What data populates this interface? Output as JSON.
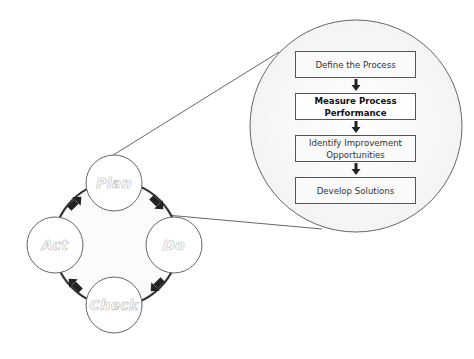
{
  "diagram": {
    "cycle": {
      "nodes": [
        {
          "id": "plan",
          "label": "Plan"
        },
        {
          "id": "do",
          "label": "Do"
        },
        {
          "id": "check",
          "label": "Check"
        },
        {
          "id": "act",
          "label": "Act"
        }
      ],
      "direction": "clockwise",
      "arrows": [
        "plan->do",
        "do->check",
        "check->act",
        "act->plan"
      ]
    },
    "zoom_detail": {
      "expands": "Plan",
      "steps": [
        {
          "label": "Define the Process",
          "emphasized": false
        },
        {
          "label": "Measure Process Performance",
          "emphasized": true
        },
        {
          "label": "Identify Improvement Opportunities",
          "emphasized": false
        },
        {
          "label": "Develop Solutions",
          "emphasized": false
        }
      ]
    },
    "colors": {
      "line": "#555555",
      "arrow": "#222222",
      "ring": "#333333",
      "node_text_outline": "#b8b8b8",
      "background": "#ffffff"
    }
  }
}
